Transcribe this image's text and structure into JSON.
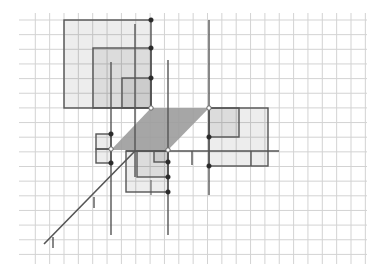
{
  "canvas": {
    "width": 384,
    "height": 277,
    "background": "#ffffff"
  },
  "colors": {
    "grid": "#d3d3d3",
    "stroke": "#555555",
    "light_fill": "rgba(0,0,0,0.07)",
    "parallelogram_fill": "#9c9c9c",
    "point": "#2b2b2b",
    "open_point_fill": "#ffffff"
  },
  "grid": {
    "x_start": 35.3,
    "x_step": 14.35,
    "x_count": 24,
    "y_start": 20,
    "y_step": 14.65,
    "y_count": 17,
    "x_extent": [
      19,
      367
    ],
    "y_extent": [
      13,
      264
    ]
  },
  "squares": [
    {
      "name": "upper-square-large",
      "x1": 64,
      "y1": 20,
      "x2": 151,
      "y2": 108
    },
    {
      "name": "upper-square-medium",
      "x1": 93,
      "y1": 48,
      "x2": 151,
      "y2": 108
    },
    {
      "name": "upper-square-small",
      "x1": 122,
      "y1": 78,
      "x2": 151,
      "y2": 108
    },
    {
      "name": "right-square-large",
      "x1": 209,
      "y1": 108,
      "x2": 268,
      "y2": 166
    },
    {
      "name": "right-square-small",
      "x1": 209,
      "y1": 108,
      "x2": 239,
      "y2": 137
    },
    {
      "name": "lower-square-large",
      "x1": 126,
      "y1": 151,
      "x2": 168,
      "y2": 192
    },
    {
      "name": "lower-square-medium",
      "x1": 137,
      "y1": 151,
      "x2": 168,
      "y2": 177
    },
    {
      "name": "lower-square-small",
      "x1": 154,
      "y1": 151,
      "x2": 168,
      "y2": 162
    },
    {
      "name": "left-square-upper",
      "x1": 96,
      "y1": 134,
      "x2": 111,
      "y2": 149
    },
    {
      "name": "left-square-lower",
      "x1": 96,
      "y1": 149,
      "x2": 111,
      "y2": 163
    }
  ],
  "parallelogram": {
    "points": [
      [
        151,
        108
      ],
      [
        209,
        108
      ],
      [
        168,
        150
      ],
      [
        111,
        150
      ]
    ]
  },
  "lines": [
    {
      "name": "vertical-line-a",
      "x1": 111,
      "y1": 62,
      "x2": 111,
      "y2": 235,
      "w": 1.4
    },
    {
      "name": "vertical-line-b",
      "x1": 135,
      "y1": 24,
      "x2": 135,
      "y2": 177,
      "w": 1.4
    },
    {
      "name": "vertical-line-c",
      "x1": 168,
      "y1": 60,
      "x2": 168,
      "y2": 235,
      "w": 1.4
    },
    {
      "name": "vertical-line-d",
      "x1": 209,
      "y1": 20,
      "x2": 209,
      "y2": 195,
      "w": 1.4
    },
    {
      "name": "horizontal-axis-line",
      "x1": 126,
      "y1": 151,
      "x2": 279,
      "y2": 151,
      "w": 1.6
    },
    {
      "name": "diagonal-axis-line",
      "x1": 44,
      "y1": 244,
      "x2": 135,
      "y2": 151,
      "w": 1.6
    },
    {
      "name": "axis-tick-1",
      "x1": 192,
      "y1": 151,
      "x2": 192,
      "y2": 165,
      "w": 1.4
    },
    {
      "name": "axis-tick-2",
      "x1": 251,
      "y1": 151,
      "x2": 251,
      "y2": 166,
      "w": 1.4
    },
    {
      "name": "axis-tick-3",
      "x1": 151,
      "y1": 180,
      "x2": 151,
      "y2": 195,
      "w": 1.0
    },
    {
      "name": "diagonal-tick-1",
      "x1": 94,
      "y1": 197,
      "x2": 94,
      "y2": 208,
      "w": 1.4
    },
    {
      "name": "diagonal-tick-2",
      "x1": 53,
      "y1": 237,
      "x2": 53,
      "y2": 248,
      "w": 1.4
    }
  ],
  "points": [
    {
      "name": "point-upper-1",
      "x": 151,
      "y": 20,
      "open": false
    },
    {
      "name": "point-upper-2",
      "x": 151,
      "y": 48,
      "open": false
    },
    {
      "name": "point-upper-3",
      "x": 151,
      "y": 78,
      "open": false
    },
    {
      "name": "point-origin-upper",
      "x": 151,
      "y": 108,
      "open": true
    },
    {
      "name": "point-origin-right",
      "x": 209,
      "y": 108,
      "open": true
    },
    {
      "name": "point-right-1",
      "x": 209,
      "y": 137,
      "open": false
    },
    {
      "name": "point-right-2",
      "x": 209,
      "y": 166,
      "open": false
    },
    {
      "name": "point-origin-lower",
      "x": 168,
      "y": 150,
      "open": true
    },
    {
      "name": "point-lower-1",
      "x": 168,
      "y": 162,
      "open": false
    },
    {
      "name": "point-lower-2",
      "x": 168,
      "y": 177,
      "open": false
    },
    {
      "name": "point-lower-3",
      "x": 168,
      "y": 192,
      "open": false
    },
    {
      "name": "point-origin-left",
      "x": 111,
      "y": 149,
      "open": true
    },
    {
      "name": "point-left-1",
      "x": 111,
      "y": 134,
      "open": false
    },
    {
      "name": "point-left-2",
      "x": 111,
      "y": 163,
      "open": false
    }
  ]
}
